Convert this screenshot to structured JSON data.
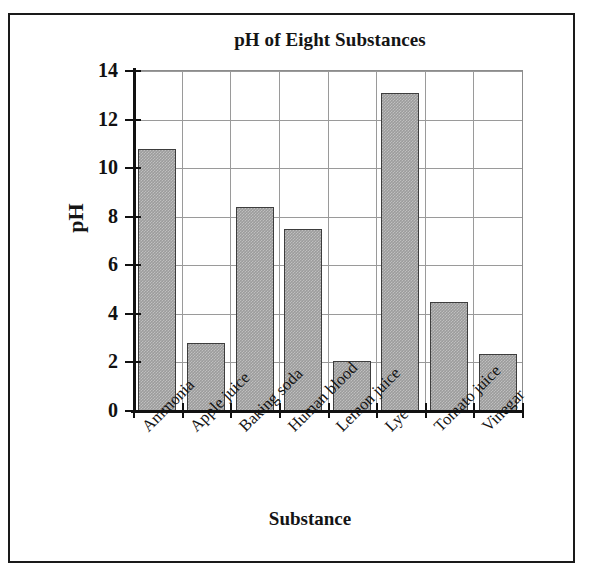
{
  "figure": {
    "background_color": "#ffffff",
    "border_color": "#1a1a1a",
    "bar_fill_color": "#9c9c9c",
    "bar_edge_color": "#3d3d3d",
    "grid_color": "#9a9a9a",
    "axis_color": "#111111"
  },
  "chart_data": {
    "type": "bar",
    "title": "pH of Eight Substances",
    "xlabel": "Substance",
    "ylabel": "pH",
    "categories": [
      "Ammonia",
      "Apple juice",
      "Baking soda",
      "Human blood",
      "Lemon juice",
      "Lye",
      "Tomato juice",
      "Vinegar"
    ],
    "values": [
      10.8,
      2.8,
      8.4,
      7.5,
      2.05,
      13.1,
      4.5,
      2.35
    ],
    "ylim": [
      0,
      14
    ],
    "ytick_labels": [
      "0",
      "2",
      "4",
      "6",
      "8",
      "10",
      "12",
      "14"
    ],
    "ytick_values": [
      0,
      2,
      4,
      6,
      8,
      10,
      12,
      14
    ],
    "grid": "both",
    "legend": "none"
  }
}
